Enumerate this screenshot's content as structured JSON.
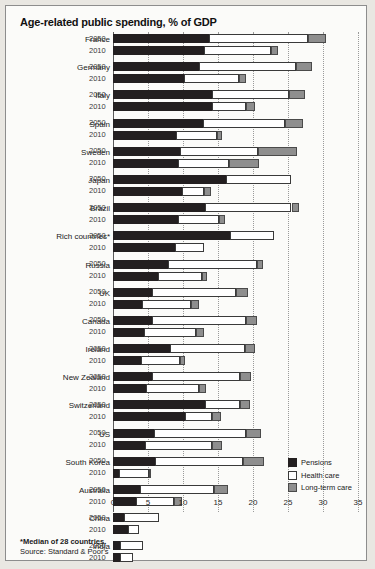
{
  "chart_title": "Age-related public spending, % of GDP",
  "footnote": "*Median of 28 countries.",
  "source": "Source: Standard & Poor's",
  "legend": {
    "items": [
      {
        "label": "Pensions",
        "color": "#231f20",
        "key": "pensions"
      },
      {
        "label": "Health care",
        "color": "#ffffff",
        "key": "health"
      },
      {
        "label": "Long-term care",
        "color": "#8e8e8e",
        "key": "ltc"
      }
    ]
  },
  "axis": {
    "ticks": [
      "0",
      "5",
      "10",
      "15",
      "20",
      "25",
      "30",
      "35"
    ],
    "min": 0,
    "max": 35,
    "step": 5
  },
  "years": [
    "2050",
    "2010"
  ],
  "chart_data": {
    "type": "bar",
    "orientation": "horizontal",
    "stacked": true,
    "title": "Age-related public spending, % of GDP",
    "xlabel": "% of GDP",
    "ylabel": "",
    "xlim": [
      0,
      35
    ],
    "grid": true,
    "legend_position": "bottom-right",
    "series": [
      {
        "name": "Pensions",
        "color": "#231f20"
      },
      {
        "name": "Health care",
        "color": "#ffffff"
      },
      {
        "name": "Long-term care",
        "color": "#8e8e8e"
      }
    ],
    "categories": [
      "France",
      "Germany",
      "Italy",
      "Spain",
      "Sweden",
      "Japan",
      "Brazil",
      "Rich countries*",
      "Russia",
      "UK",
      "Canada",
      "Ireland",
      "New Zealand",
      "Switzerland",
      "US",
      "South Korea",
      "Australia",
      "China",
      "India"
    ],
    "rows": [
      {
        "country": "France",
        "year": "2050",
        "pensions": 13.7,
        "health": 14.1,
        "ltc": 2.6,
        "total": 30.4
      },
      {
        "country": "France",
        "year": "2010",
        "pensions": 13.0,
        "health": 9.6,
        "ltc": 1.0,
        "total": 23.6
      },
      {
        "country": "Germany",
        "year": "2050",
        "pensions": 12.3,
        "health": 13.9,
        "ltc": 2.3,
        "total": 28.5
      },
      {
        "country": "Germany",
        "year": "2010",
        "pensions": 10.2,
        "health": 7.8,
        "ltc": 1.0,
        "total": 19.0
      },
      {
        "country": "Italy",
        "year": "2050",
        "pensions": 14.2,
        "health": 10.9,
        "ltc": 2.4,
        "total": 27.5
      },
      {
        "country": "Italy",
        "year": "2010",
        "pensions": 14.1,
        "health": 4.9,
        "ltc": 1.3,
        "total": 20.3
      },
      {
        "country": "Spain",
        "year": "2050",
        "pensions": 12.8,
        "health": 11.8,
        "ltc": 2.5,
        "total": 27.1
      },
      {
        "country": "Spain",
        "year": "2010",
        "pensions": 9.0,
        "health": 5.8,
        "ltc": 0.8,
        "total": 15.6
      },
      {
        "country": "Sweden",
        "year": "2050",
        "pensions": 9.5,
        "health": 11.2,
        "ltc": 5.6,
        "total": 26.3
      },
      {
        "country": "Sweden",
        "year": "2010",
        "pensions": 9.3,
        "health": 7.3,
        "ltc": 4.3,
        "total": 20.9
      },
      {
        "country": "Japan",
        "year": "2050",
        "pensions": 16.2,
        "health": 9.3,
        "ltc": 0.0,
        "total": 25.5
      },
      {
        "country": "Japan",
        "year": "2010",
        "pensions": 9.9,
        "health": 3.1,
        "ltc": 1.0,
        "total": 14.0
      },
      {
        "country": "Brazil",
        "year": "2050",
        "pensions": 13.2,
        "health": 12.3,
        "ltc": 1.1,
        "total": 26.6
      },
      {
        "country": "Brazil",
        "year": "2010",
        "pensions": 9.3,
        "health": 5.9,
        "ltc": 0.8,
        "total": 16.0
      },
      {
        "country": "Rich countries*",
        "year": "2050",
        "pensions": 16.7,
        "health": 6.3,
        "ltc": 0.0,
        "total": 23.0
      },
      {
        "country": "Rich countries*",
        "year": "2010",
        "pensions": 8.9,
        "health": 4.1,
        "ltc": 0.0,
        "total": 13.0
      },
      {
        "country": "Russia",
        "year": "2050",
        "pensions": 7.8,
        "health": 12.8,
        "ltc": 0.8,
        "total": 21.4
      },
      {
        "country": "Russia",
        "year": "2010",
        "pensions": 6.4,
        "health": 6.3,
        "ltc": 0.7,
        "total": 13.4
      },
      {
        "country": "UK",
        "year": "2050",
        "pensions": 5.6,
        "health": 12.0,
        "ltc": 1.7,
        "total": 19.3
      },
      {
        "country": "UK",
        "year": "2010",
        "pensions": 4.2,
        "health": 7.0,
        "ltc": 1.1,
        "total": 12.3
      },
      {
        "country": "Canada",
        "year": "2050",
        "pensions": 5.5,
        "health": 13.5,
        "ltc": 1.6,
        "total": 20.6
      },
      {
        "country": "Canada",
        "year": "2010",
        "pensions": 4.4,
        "health": 7.4,
        "ltc": 1.2,
        "total": 13.0
      },
      {
        "country": "Ireland",
        "year": "2050",
        "pensions": 8.1,
        "health": 10.8,
        "ltc": 1.4,
        "total": 20.3
      },
      {
        "country": "Ireland",
        "year": "2010",
        "pensions": 4.0,
        "health": 5.5,
        "ltc": 0.8,
        "total": 10.3
      },
      {
        "country": "New Zealand",
        "year": "2050",
        "pensions": 5.6,
        "health": 12.6,
        "ltc": 1.5,
        "total": 19.7
      },
      {
        "country": "New Zealand",
        "year": "2010",
        "pensions": 4.7,
        "health": 7.6,
        "ltc": 1.0,
        "total": 13.3
      },
      {
        "country": "Switzerland",
        "year": "2050",
        "pensions": 13.1,
        "health": 5.0,
        "ltc": 1.5,
        "total": 19.6
      },
      {
        "country": "Switzerland",
        "year": "2010",
        "pensions": 10.3,
        "health": 3.8,
        "ltc": 1.3,
        "total": 15.4
      },
      {
        "country": "US",
        "year": "2050",
        "pensions": 5.9,
        "health": 13.1,
        "ltc": 2.1,
        "total": 21.1
      },
      {
        "country": "US",
        "year": "2010",
        "pensions": 4.5,
        "health": 9.7,
        "ltc": 1.4,
        "total": 15.6
      },
      {
        "country": "South Korea",
        "year": "2050",
        "pensions": 6.0,
        "health": 12.6,
        "ltc": 3.0,
        "total": 21.6
      },
      {
        "country": "South Korea",
        "year": "2010",
        "pensions": 0.9,
        "health": 4.2,
        "ltc": 0.4,
        "total": 5.5
      },
      {
        "country": "Australia",
        "year": "2050",
        "pensions": 3.8,
        "health": 10.6,
        "ltc": 2.1,
        "total": 16.5
      },
      {
        "country": "Australia",
        "year": "2010",
        "pensions": 3.3,
        "health": 5.4,
        "ltc": 1.1,
        "total": 9.8
      },
      {
        "country": "China",
        "year": "2050",
        "pensions": 1.5,
        "health": 5.1,
        "ltc": 0.0,
        "total": 6.6
      },
      {
        "country": "China",
        "year": "2010",
        "pensions": 2.2,
        "health": 1.5,
        "ltc": 0.0,
        "total": 3.7
      },
      {
        "country": "India",
        "year": "2050",
        "pensions": 1.0,
        "health": 3.3,
        "ltc": 0.0,
        "total": 4.3
      },
      {
        "country": "India",
        "year": "2010",
        "pensions": 1.0,
        "health": 1.8,
        "ltc": 0.0,
        "total": 2.8
      }
    ]
  }
}
